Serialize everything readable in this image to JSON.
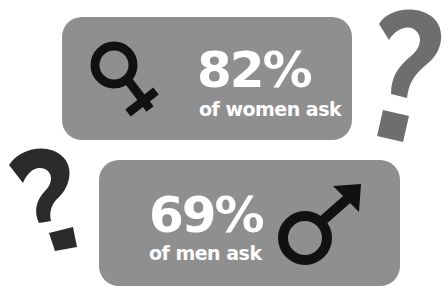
{
  "women": {
    "percent": "82%",
    "label": "of women ask",
    "icon": "female-symbol-icon"
  },
  "men": {
    "percent": "69%",
    "label": "of men ask",
    "icon": "male-symbol-icon"
  },
  "decorations": {
    "question_mark_right": "question-mark-icon",
    "question_mark_left": "question-mark-icon"
  },
  "colors": {
    "box": "#8f8f8f",
    "text": "#ffffff",
    "symbol": "#111111",
    "qmark_gray": "#6e6e6e",
    "qmark_dark": "#2b2b2b"
  }
}
